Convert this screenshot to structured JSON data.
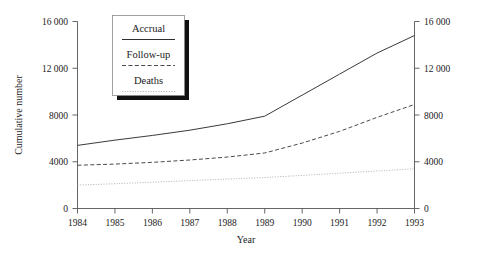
{
  "chart_data": {
    "type": "line",
    "title": "",
    "xlabel": "Year",
    "ylabel": "Cumulative number",
    "ylabel_right": "Cumulative number",
    "x": [
      1984,
      1985,
      1986,
      1987,
      1988,
      1989,
      1990,
      1991,
      1992,
      1993
    ],
    "categories": [
      "1984",
      "1985",
      "1986",
      "1987",
      "1988",
      "1989",
      "1990",
      "1991",
      "1992",
      "1993"
    ],
    "xlim": [
      1984,
      1993
    ],
    "ylim": [
      0,
      16000
    ],
    "yticks": [
      0,
      4000,
      8000,
      12000,
      16000
    ],
    "ytick_labels": [
      "0",
      "4000",
      "8000",
      "12 000",
      "16 000"
    ],
    "ytick_labels_right": [
      "0",
      "4000",
      "8000",
      "12 000",
      "16 000"
    ],
    "grid": false,
    "legend_position": "top-left-inside",
    "series": [
      {
        "name": "Accrual",
        "style": "solid",
        "color": "#3a3a3a",
        "values": [
          5400,
          5850,
          6250,
          6700,
          7250,
          7900,
          9700,
          11500,
          13300,
          14800
        ]
      },
      {
        "name": "Follow-up",
        "style": "dashed",
        "color": "#4a4a4a",
        "values": [
          3700,
          3800,
          3950,
          4150,
          4400,
          4750,
          5600,
          6600,
          7800,
          8900
        ]
      },
      {
        "name": "Deaths",
        "style": "dotted",
        "color": "#b8b8b8",
        "values": [
          2000,
          2120,
          2250,
          2380,
          2520,
          2650,
          2830,
          3020,
          3210,
          3400
        ]
      }
    ]
  },
  "legend": {
    "items": [
      {
        "label": "Accrual",
        "style": "solid"
      },
      {
        "label": "Follow-up",
        "style": "dashed"
      },
      {
        "label": "Deaths",
        "style": "dotted"
      }
    ]
  },
  "axes": {
    "x_title": "Year",
    "y_title": "Cumulative number"
  }
}
